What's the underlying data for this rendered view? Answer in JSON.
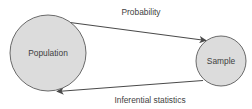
{
  "diagram": {
    "type": "cycle-diagram",
    "background_color": "#ffffff",
    "nodes": [
      {
        "id": "population",
        "label": "Population",
        "shape": "circle",
        "cx": 48,
        "cy": 53,
        "r": 38,
        "fill_color": "#dcdcdc",
        "stroke_color": "#5a5a5a",
        "text_color": "#3f3f3f"
      },
      {
        "id": "sample",
        "label": "Sample",
        "shape": "circle",
        "cx": 221,
        "cy": 61,
        "r": 25,
        "fill_color": "#dcdcdc",
        "stroke_color": "#5a5a5a",
        "text_color": "#3f3f3f"
      }
    ],
    "edges": [
      {
        "id": "probability",
        "label": "Probability",
        "from": "population",
        "to": "sample",
        "direction": "right",
        "label_x": 141,
        "label_y": 13,
        "stroke_color": "#4a4a4a"
      },
      {
        "id": "inferential-statistics",
        "label": "Inferential statistics",
        "from": "sample",
        "to": "population",
        "direction": "left",
        "label_x": 150,
        "label_y": 101,
        "stroke_color": "#4a4a4a"
      }
    ]
  }
}
